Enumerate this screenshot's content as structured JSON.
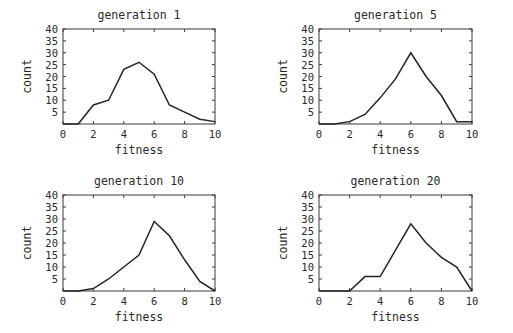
{
  "figure": {
    "background_color": "#ffffff",
    "line_color": "#242424",
    "frame_color": "#3a3a3a",
    "text_color": "#2b2b2b",
    "panel_count": 4
  },
  "axis_common": {
    "xlabel": "fitness",
    "ylabel": "count",
    "xticks": [
      "0",
      "2",
      "4",
      "6",
      "8",
      "10"
    ],
    "yticks": [
      "40",
      "35",
      "30",
      "25",
      "20",
      "15",
      "10",
      "5"
    ],
    "xlim": [
      0,
      10
    ],
    "ylim": [
      0,
      40
    ],
    "grid": false
  },
  "chart_data": [
    {
      "type": "line",
      "title": "generation 1",
      "xlabel": "fitness",
      "ylabel": "count",
      "xlim": [
        0,
        10
      ],
      "ylim": [
        0,
        40
      ],
      "xticks": [
        0,
        2,
        4,
        6,
        8,
        10
      ],
      "yticks": [
        5,
        10,
        15,
        20,
        25,
        30,
        35,
        40
      ],
      "grid": false,
      "legend": null,
      "x": [
        0,
        1,
        2,
        3,
        4,
        5,
        6,
        7,
        8,
        9,
        10
      ],
      "values": [
        0,
        0,
        8,
        10,
        23,
        26,
        21,
        8,
        5,
        2,
        1
      ]
    },
    {
      "type": "line",
      "title": "generation 5",
      "xlabel": "fitness",
      "ylabel": "count",
      "xlim": [
        0,
        10
      ],
      "ylim": [
        0,
        40
      ],
      "xticks": [
        0,
        2,
        4,
        6,
        8,
        10
      ],
      "yticks": [
        5,
        10,
        15,
        20,
        25,
        30,
        35,
        40
      ],
      "grid": false,
      "legend": null,
      "x": [
        0,
        1,
        2,
        3,
        4,
        5,
        6,
        7,
        8,
        9,
        10
      ],
      "values": [
        0,
        0,
        1,
        4,
        11,
        19,
        30,
        20,
        12,
        1,
        1
      ]
    },
    {
      "type": "line",
      "title": "generation 10",
      "xlabel": "fitness",
      "ylabel": "count",
      "xlim": [
        0,
        10
      ],
      "ylim": [
        0,
        40
      ],
      "xticks": [
        0,
        2,
        4,
        6,
        8,
        10
      ],
      "yticks": [
        5,
        10,
        15,
        20,
        25,
        30,
        35,
        40
      ],
      "grid": false,
      "legend": null,
      "x": [
        0,
        1,
        2,
        3,
        4,
        5,
        6,
        7,
        8,
        9,
        10
      ],
      "values": [
        0,
        0,
        1,
        5,
        10,
        15,
        29,
        23,
        13,
        4,
        0
      ]
    },
    {
      "type": "line",
      "title": "generation 20",
      "xlabel": "fitness",
      "ylabel": "count",
      "xlim": [
        0,
        10
      ],
      "ylim": [
        0,
        40
      ],
      "xticks": [
        0,
        2,
        4,
        6,
        8,
        10
      ],
      "yticks": [
        5,
        10,
        15,
        20,
        25,
        30,
        35,
        40
      ],
      "grid": false,
      "legend": null,
      "x": [
        0,
        1,
        2,
        3,
        4,
        5,
        6,
        7,
        8,
        9,
        10
      ],
      "values": [
        0,
        0,
        0,
        6,
        6,
        17,
        28,
        20,
        14,
        10,
        0
      ]
    }
  ]
}
